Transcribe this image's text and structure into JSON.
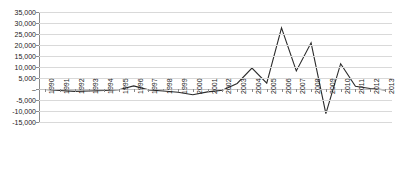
{
  "chart_data": {
    "type": "line",
    "title": "",
    "subtitle": "",
    "xlabel": "",
    "ylabel": "",
    "grid": true,
    "legend": false,
    "legend_position": "none",
    "categories": [
      "1990",
      "1991",
      "1992",
      "1993",
      "1994",
      "1995",
      "1996",
      "1997",
      "1998",
      "1999",
      "2000",
      "2001",
      "2002",
      "2003",
      "2004",
      "2005",
      "2006",
      "2007",
      "2008",
      "2009",
      "2010",
      "2011",
      "2012",
      "2013"
    ],
    "values": [
      -200,
      -700,
      -1100,
      -900,
      -700,
      -300,
      1400,
      -400,
      -900,
      -1500,
      -2600,
      -1300,
      -600,
      2500,
      9500,
      2700,
      27800,
      8200,
      21000,
      -11200,
      11500,
      1200,
      200,
      -400
    ],
    "series": [
      {
        "name": "series-1",
        "values": [
          -200,
          -700,
          -1100,
          -900,
          -700,
          -300,
          1400,
          -400,
          -900,
          -1500,
          -2600,
          -1300,
          -600,
          2500,
          9500,
          2700,
          27800,
          8200,
          21000,
          -11200,
          11500,
          1200,
          200,
          -400
        ]
      }
    ],
    "ylim": [
      -15000,
      35000
    ],
    "ytick_values": [
      35000,
      30000,
      25000,
      20000,
      15000,
      10000,
      5000,
      0,
      -5000,
      -10000,
      -15000
    ],
    "ytick_labels": [
      "35,000",
      "30,000",
      "25,000",
      "20,000",
      "15,000",
      "10,000",
      "5,000",
      "–",
      "-5,000",
      "-10,000",
      "-15,000"
    ],
    "line_color": "#2b2b2b",
    "grid_color": "#d9d9d9",
    "axis_color": "#8a8a8a",
    "background_color": "#ffffff"
  }
}
